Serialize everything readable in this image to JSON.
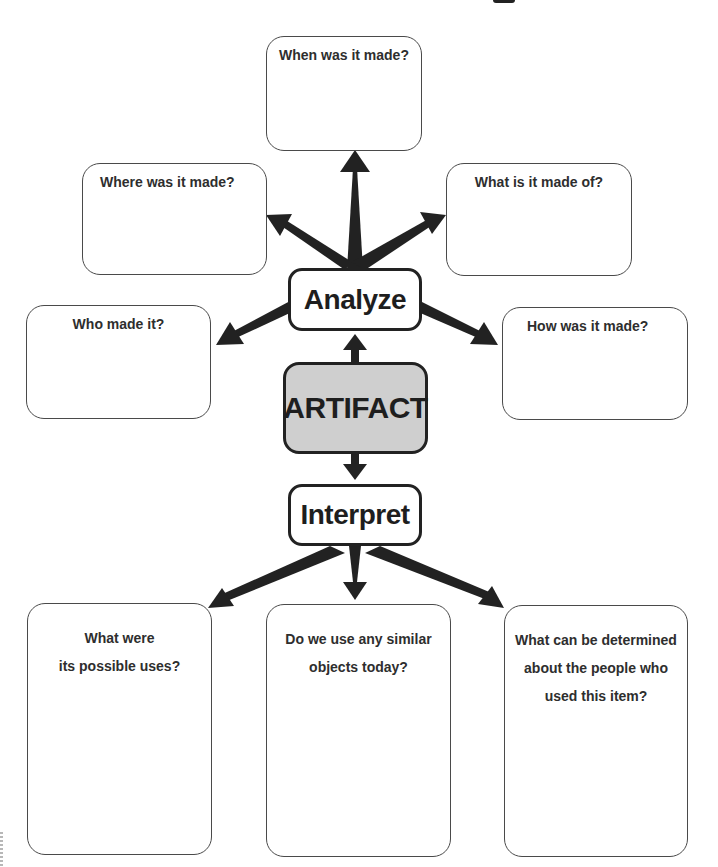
{
  "diagram": {
    "center_node": {
      "label": "ARTIFACT",
      "fill": "#cfcfcf"
    },
    "upper_node": {
      "label": "Analyze"
    },
    "lower_node": {
      "label": "Interpret"
    },
    "analyze_questions": [
      {
        "id": "when",
        "label": "When was it made?"
      },
      {
        "id": "where",
        "label": "Where was it made?"
      },
      {
        "id": "what-of",
        "label": "What is it made of?"
      },
      {
        "id": "who",
        "label": "Who made it?"
      },
      {
        "id": "how",
        "label": "How was it made?"
      }
    ],
    "interpret_questions": [
      {
        "id": "uses",
        "label": "What were\nits possible uses?"
      },
      {
        "id": "similar",
        "label": "Do we use any similar\nobjects today?"
      },
      {
        "id": "people",
        "label": "What can be determined\nabout the people who\nused this item?"
      }
    ],
    "colors": {
      "stroke": "#222222",
      "box_border": "#4a4a4a",
      "center_fill": "#cfcfcf"
    }
  }
}
